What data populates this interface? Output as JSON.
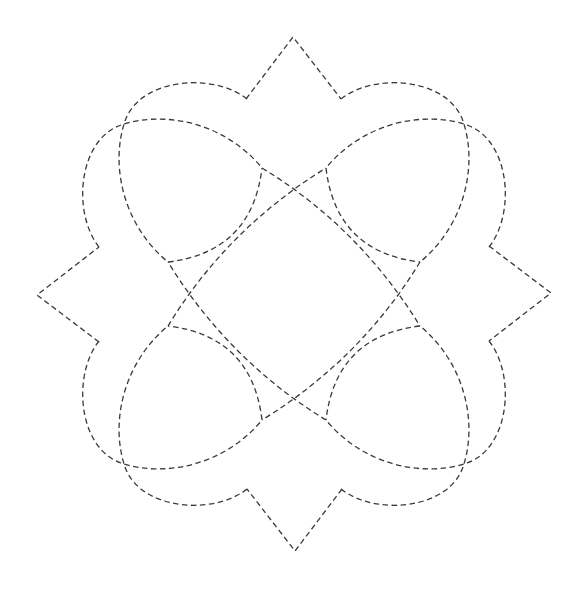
{
  "figure": {
    "title": "Dashed geometric star-flower figure",
    "symmetry": "4-fold rotational with mirror (D4)",
    "center": [
      294,
      294
    ],
    "stroke_color": "#3a3a3a",
    "background_color": "#ffffff",
    "line_style": "dashed",
    "components": {
      "spikes": 4,
      "outer_arcs": 8,
      "long_arcs": 4,
      "inner_arcs": 4
    },
    "spike_apexes": [
      [
        293,
        37
      ],
      [
        551,
        294
      ],
      [
        294,
        551
      ],
      [
        37,
        294
      ]
    ],
    "tips": [
      [
        168,
        262
      ],
      [
        262,
        168
      ],
      [
        326,
        168
      ],
      [
        420,
        262
      ],
      [
        420,
        326
      ],
      [
        326,
        420
      ],
      [
        262,
        420
      ],
      [
        168,
        326
      ]
    ],
    "crossings": [
      [
        294,
        190
      ],
      [
        397,
        294
      ],
      [
        294,
        397
      ],
      [
        190,
        294
      ],
      [
        123,
        123
      ],
      [
        465,
        123
      ],
      [
        465,
        465
      ],
      [
        123,
        465
      ]
    ]
  }
}
